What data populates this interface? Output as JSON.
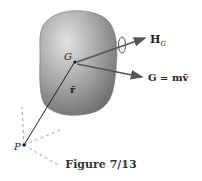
{
  "figure": {
    "caption": "Figure 7/13",
    "labels": {
      "center_of_mass": "G",
      "position_vector": "r̄",
      "angular_momentum_symbol": "H",
      "angular_momentum_subscript": "G",
      "linear_momentum": "G = mv̄",
      "point": "P"
    },
    "colors": {
      "body_light": "#d9d9d9",
      "body_dark": "#6e6e6e",
      "line": "#333333"
    }
  }
}
